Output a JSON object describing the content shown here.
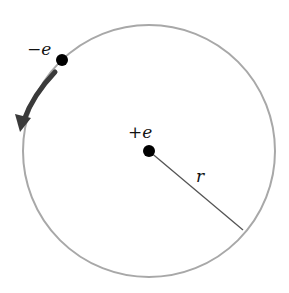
{
  "diagram": {
    "labels": {
      "electron": "−e",
      "nucleus": "+e",
      "radius": "r"
    },
    "colors": {
      "orbit": "#a8a8a8",
      "arrow": "#3a3a3a",
      "charges": "#000000",
      "radius_line": "#555555"
    }
  }
}
